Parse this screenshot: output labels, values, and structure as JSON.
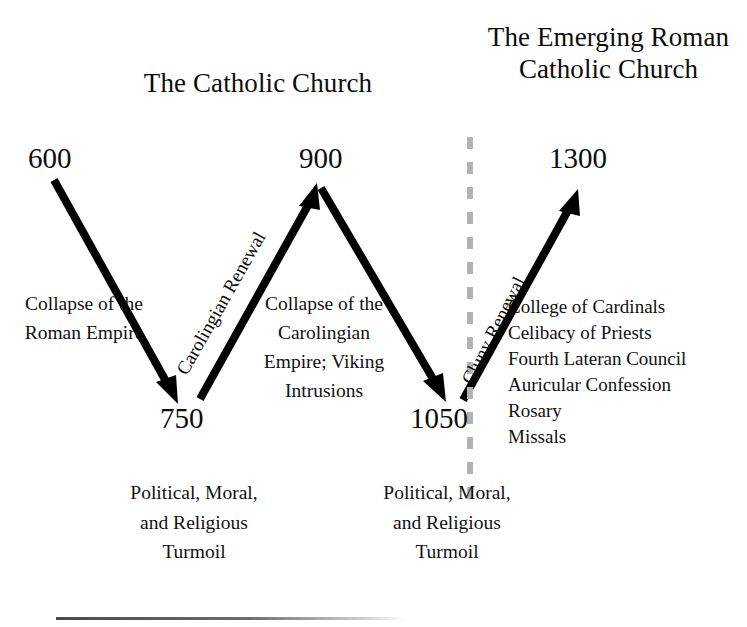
{
  "diagram": {
    "titles": {
      "left": "The Catholic Church",
      "right": "The Emerging Roman Catholic Church"
    },
    "years": {
      "start": "600",
      "first_trough": "750",
      "peak": "900",
      "second_trough": "1050",
      "end": "1300"
    },
    "arrow_labels": {
      "carolingian": "Carolingian Renewal",
      "cluny": "Cluny Renewal"
    },
    "descriptions": {
      "collapse_roman": "Collapse of the Roman Empire",
      "collapse_carolingian": "Collapse of the Carolingian Empire; Viking Intrusions"
    },
    "turmoil": {
      "left": "Political, Moral, and Religious Turmoil",
      "right": "Political, Moral, and Religious Turmoil"
    },
    "practices": [
      "College of Cardinals",
      "Celibacy of Priests",
      "Fourth Lateran Council",
      "Auricular Confession",
      "Rosary",
      "Missals"
    ],
    "colors": {
      "ink": "#111111",
      "arrow": "#000000",
      "divider": "#b3b3b3",
      "rule": "#4a4a4a",
      "background": "#ffffff"
    }
  }
}
